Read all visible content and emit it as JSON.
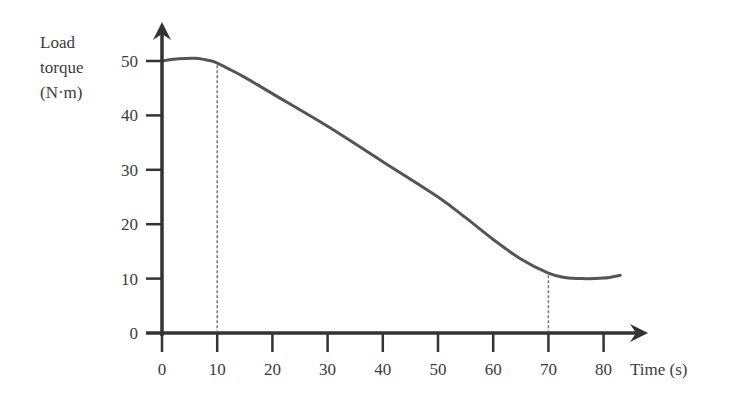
{
  "chart_data": {
    "type": "line",
    "title": "",
    "ylabel_lines": [
      "Load",
      "torque",
      "(N·m)"
    ],
    "xlabel": "Time (s)",
    "xlim": [
      0,
      85
    ],
    "ylim": [
      0,
      55
    ],
    "x_ticks": [
      0,
      10,
      20,
      30,
      40,
      50,
      60,
      70,
      80
    ],
    "y_ticks": [
      0,
      10,
      20,
      30,
      40,
      50
    ],
    "grid": false,
    "legend": null,
    "series": [
      {
        "name": "Load torque",
        "x": [
          0,
          3,
          6,
          9,
          10,
          12,
          15,
          20,
          30,
          40,
          50,
          55,
          60,
          65,
          70,
          73,
          76,
          80,
          83
        ],
        "y": [
          50,
          50.4,
          50.5,
          50.0,
          49.6,
          48.6,
          47.0,
          44.0,
          38.0,
          31.5,
          25.0,
          21.2,
          17.2,
          13.6,
          11.0,
          10.2,
          10.0,
          10.1,
          10.6
        ]
      }
    ],
    "annotations": [
      {
        "type": "vertical-dashed-line",
        "x": 10,
        "from_y": 0,
        "to_y": 49.6
      },
      {
        "type": "vertical-dashed-line",
        "x": 70,
        "from_y": 0,
        "to_y": 11.0
      }
    ]
  }
}
